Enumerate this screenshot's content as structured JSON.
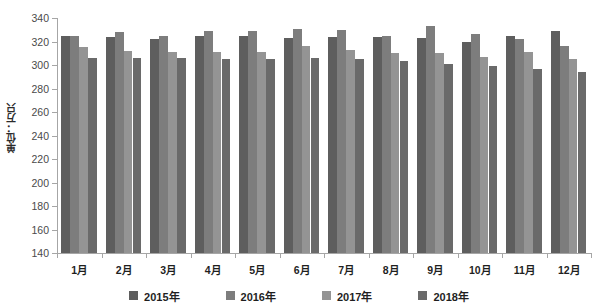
{
  "chart_data": {
    "type": "bar",
    "title": "",
    "xlabel": "",
    "ylabel": "单位：万只",
    "ylim": [
      140,
      340
    ],
    "ytick_step": 20,
    "yticks": [
      340,
      320,
      300,
      280,
      260,
      240,
      220,
      200,
      180,
      160,
      140
    ],
    "grid": false,
    "legend_position": "bottom",
    "categories": [
      "1月",
      "2月",
      "3月",
      "4月",
      "5月",
      "6月",
      "7月",
      "8月",
      "9月",
      "10月",
      "11月",
      "12月"
    ],
    "series": [
      {
        "name": "2015年",
        "color": "#5e5e5e",
        "values": [
          325,
          324,
          322,
          325,
          325,
          323,
          324,
          324,
          323,
          320,
          325,
          329
        ]
      },
      {
        "name": "2016年",
        "color": "#7d7d7d",
        "values": [
          325,
          328,
          325,
          329,
          329,
          331,
          330,
          325,
          333,
          326,
          322,
          316
        ]
      },
      {
        "name": "2017年",
        "color": "#949494",
        "values": [
          315,
          312,
          311,
          311,
          311,
          316,
          313,
          310,
          310,
          307,
          311,
          305
        ]
      },
      {
        "name": "2018年",
        "color": "#6a6a6a",
        "values": [
          306,
          306,
          306,
          305,
          305,
          306,
          305,
          303,
          301,
          299,
          297,
          294
        ]
      }
    ]
  },
  "legend": {
    "items": [
      {
        "label": "2015年"
      },
      {
        "label": "2016年"
      },
      {
        "label": "2017年"
      },
      {
        "label": "2018年"
      }
    ]
  },
  "axis": {
    "y_title": "单位：万只"
  }
}
